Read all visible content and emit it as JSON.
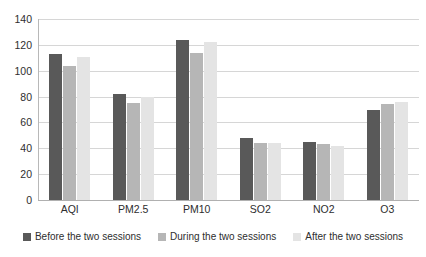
{
  "chart_data": {
    "type": "bar",
    "title": "",
    "subtitle": "",
    "xlabel": "",
    "ylabel": "",
    "categories": [
      "AQI",
      "PM2.5",
      "PM10",
      "SO2",
      "NO2",
      "O3"
    ],
    "series": [
      {
        "name": "Before the two sessions",
        "color": "#595959",
        "values": [
          113,
          82,
          124,
          48,
          45,
          70
        ]
      },
      {
        "name": "During the two sessions",
        "color": "#b6b6b6",
        "values": [
          104,
          75,
          114,
          44,
          43,
          74
        ]
      },
      {
        "name": "After the two sessions",
        "color": "#e4e4e4",
        "values": [
          111,
          80,
          122,
          44,
          42,
          76
        ]
      }
    ],
    "ylim": [
      0,
      140
    ],
    "yticks": [
      0,
      20,
      40,
      60,
      80,
      100,
      120,
      140
    ],
    "ytick_labels": [
      "0",
      "20",
      "40",
      "60",
      "80",
      "100",
      "120",
      "140"
    ],
    "grid": true,
    "grid_axis": "y",
    "legend_position": "bottom",
    "bar_mode": "grouped"
  }
}
